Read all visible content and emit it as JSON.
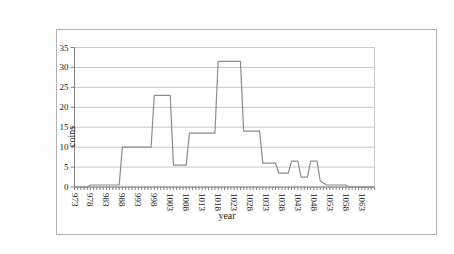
{
  "chart": {
    "frame_border_color": "#b3b3b3",
    "background": "#ffffff",
    "line_color": "#8c8c8c",
    "gridline_color": "#c9c9c9",
    "axis_color": "#808080",
    "tick_color": "#808080",
    "text_color": "#1a1a1a"
  },
  "chart_data": {
    "type": "line",
    "title": "",
    "xlabel": "year",
    "ylabel": "coins",
    "legend": "none",
    "grid": "horizontal",
    "xlim": [
      973,
      1067
    ],
    "ylim": [
      0,
      35
    ],
    "y_ticks": [
      0,
      5,
      10,
      15,
      20,
      25,
      30,
      35
    ],
    "x_tick_labels": [
      973,
      978,
      983,
      988,
      993,
      998,
      1003,
      1008,
      1013,
      1018,
      1023,
      1028,
      1033,
      1038,
      1043,
      1048,
      1053,
      1058,
      1063
    ],
    "x_minor_tick_every": 1,
    "series": [
      {
        "name": "coins",
        "points": [
          [
            973,
            0
          ],
          [
            974,
            0
          ],
          [
            975,
            0
          ],
          [
            976,
            0
          ],
          [
            977,
            0
          ],
          [
            978,
            0.5
          ],
          [
            979,
            0.5
          ],
          [
            980,
            0.5
          ],
          [
            981,
            0.5
          ],
          [
            982,
            0.5
          ],
          [
            983,
            0.5
          ],
          [
            984,
            0.5
          ],
          [
            985,
            0.5
          ],
          [
            986,
            0.5
          ],
          [
            987,
            0.5
          ],
          [
            988,
            10
          ],
          [
            989,
            10
          ],
          [
            990,
            10
          ],
          [
            991,
            10
          ],
          [
            992,
            10
          ],
          [
            993,
            10
          ],
          [
            994,
            10
          ],
          [
            995,
            10
          ],
          [
            996,
            10
          ],
          [
            997,
            10
          ],
          [
            998,
            23
          ],
          [
            999,
            23
          ],
          [
            1000,
            23
          ],
          [
            1001,
            23
          ],
          [
            1002,
            23
          ],
          [
            1003,
            23
          ],
          [
            1004,
            5.5
          ],
          [
            1005,
            5.5
          ],
          [
            1006,
            5.5
          ],
          [
            1007,
            5.5
          ],
          [
            1008,
            5.5
          ],
          [
            1009,
            13.5
          ],
          [
            1010,
            13.5
          ],
          [
            1011,
            13.5
          ],
          [
            1012,
            13.5
          ],
          [
            1013,
            13.5
          ],
          [
            1014,
            13.5
          ],
          [
            1015,
            13.5
          ],
          [
            1016,
            13.5
          ],
          [
            1017,
            13.5
          ],
          [
            1018,
            31.5
          ],
          [
            1019,
            31.5
          ],
          [
            1020,
            31.5
          ],
          [
            1021,
            31.5
          ],
          [
            1022,
            31.5
          ],
          [
            1023,
            31.5
          ],
          [
            1024,
            31.5
          ],
          [
            1025,
            31.5
          ],
          [
            1026,
            14
          ],
          [
            1027,
            14
          ],
          [
            1028,
            14
          ],
          [
            1029,
            14
          ],
          [
            1030,
            14
          ],
          [
            1031,
            14
          ],
          [
            1032,
            6
          ],
          [
            1033,
            6
          ],
          [
            1034,
            6
          ],
          [
            1035,
            6
          ],
          [
            1036,
            6
          ],
          [
            1037,
            3.5
          ],
          [
            1038,
            3.5
          ],
          [
            1039,
            3.5
          ],
          [
            1040,
            3.5
          ],
          [
            1041,
            6.5
          ],
          [
            1042,
            6.5
          ],
          [
            1043,
            6.5
          ],
          [
            1044,
            2.5
          ],
          [
            1045,
            2.5
          ],
          [
            1046,
            2.5
          ],
          [
            1047,
            6.5
          ],
          [
            1048,
            6.5
          ],
          [
            1049,
            6.5
          ],
          [
            1050,
            1.5
          ],
          [
            1051,
            1
          ],
          [
            1052,
            0.5
          ],
          [
            1053,
            0.5
          ],
          [
            1054,
            0.5
          ],
          [
            1055,
            0.5
          ],
          [
            1056,
            0.5
          ],
          [
            1057,
            0.5
          ],
          [
            1058,
            0.5
          ],
          [
            1059,
            0
          ],
          [
            1060,
            0
          ],
          [
            1061,
            0
          ],
          [
            1062,
            0
          ],
          [
            1063,
            0
          ],
          [
            1064,
            0
          ],
          [
            1065,
            0
          ],
          [
            1066,
            0
          ],
          [
            1067,
            0
          ]
        ]
      }
    ]
  }
}
